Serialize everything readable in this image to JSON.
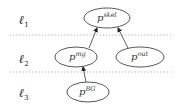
{
  "diagram": {
    "levels": [
      {
        "symbol": "ℓ",
        "subscript": "1",
        "y": 22
      },
      {
        "symbol": "ℓ",
        "subscript": "2",
        "y": 61
      },
      {
        "symbol": "ℓ",
        "subscript": "3",
        "y": 95
      }
    ],
    "separators": [
      35,
      72
    ],
    "nodes": [
      {
        "id": "skel",
        "base": "p",
        "sup": "skel",
        "level": 1
      },
      {
        "id": "mg",
        "base": "p",
        "sup": "mg",
        "level": 2
      },
      {
        "id": "out",
        "base": "p",
        "sup": "out",
        "level": 2
      },
      {
        "id": "BG",
        "base": "p",
        "sup": "BG",
        "level": 3
      }
    ],
    "edges": [
      {
        "from": "mg",
        "to": "skel"
      },
      {
        "from": "out",
        "to": "skel"
      },
      {
        "from": "BG",
        "to": "mg"
      }
    ]
  }
}
